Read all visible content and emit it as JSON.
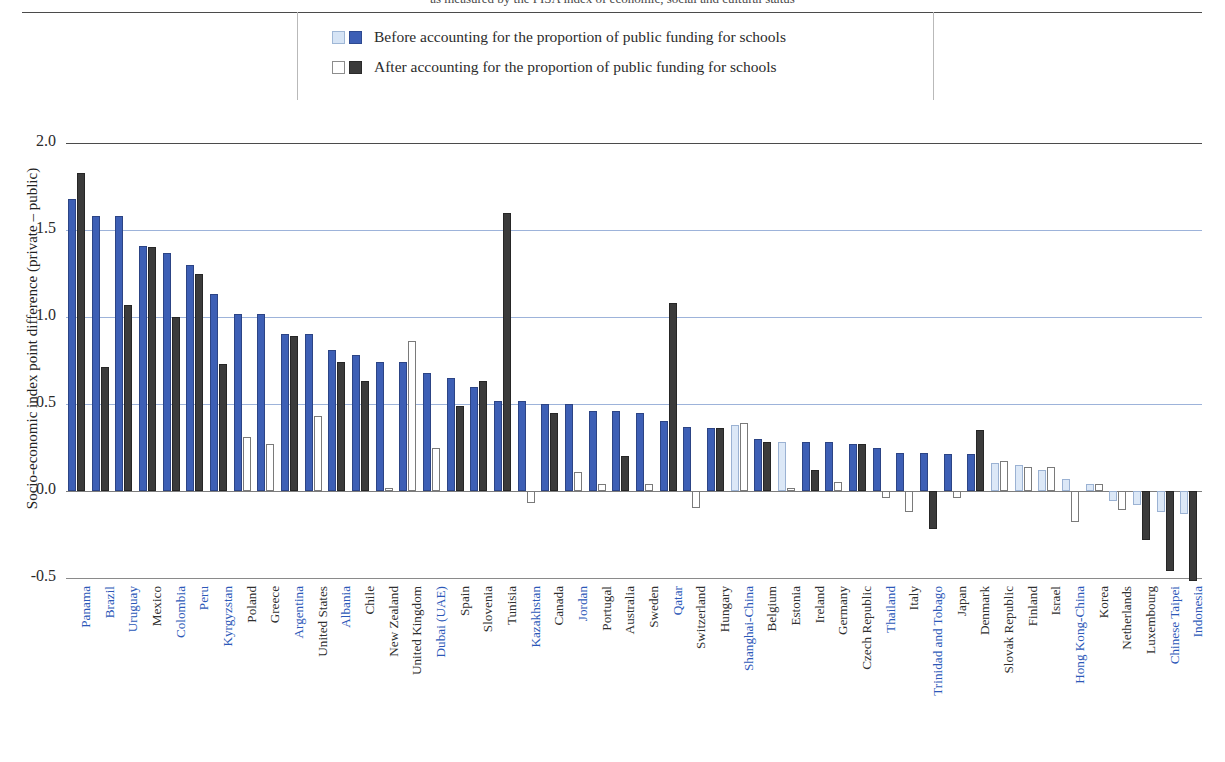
{
  "header": {
    "title_partial": "as measured by the PISA index of economic, social and cultural status"
  },
  "legend": {
    "items": [
      {
        "label": "Before accounting for the proportion of public funding for schools",
        "swatches": [
          "light-blue",
          "blue"
        ]
      },
      {
        "label": "After accounting for the proportion of public funding for schools",
        "swatches": [
          "white",
          "dark-grey"
        ]
      }
    ]
  },
  "colors": {
    "before_significant": "#3d5fb5",
    "before_nonsignificant": "#dce8f7",
    "after_significant": "#3b3b3b",
    "after_nonsignificant": "#ffffff",
    "gridline": "#9db3da",
    "highlight_label": "#2c58b8",
    "normal_label": "#2e2e2e"
  },
  "chart_data": {
    "type": "bar",
    "title": "as measured by the PISA index of economic, social and cultural status",
    "xlabel": "",
    "ylabel": "Socio-economic index point difference (private – public)",
    "ylim": [
      -0.5,
      2.0
    ],
    "yticks": [
      "2.0",
      "1.5",
      "1.0",
      "0.5",
      "0.0",
      "-0.5"
    ],
    "ytick_values": [
      2.0,
      1.5,
      1.0,
      0.5,
      0.0,
      -0.5
    ],
    "grid": true,
    "legend_position": "top-center",
    "categories": [
      "Panama",
      "Brazil",
      "Uruguay",
      "Mexico",
      "Colombia",
      "Peru",
      "Kyrgyzstan",
      "Poland",
      "Greece",
      "Argentina",
      "United States",
      "Albania",
      "Chile",
      "New Zealand",
      "United Kingdom",
      "Dubai (UAE)",
      "Spain",
      "Slovenia",
      "Tunisia",
      "Kazakhstan",
      "Canada",
      "Jordan",
      "Portugal",
      "Australia",
      "Sweden",
      "Qatar",
      "Switzerland",
      "Hungary",
      "Shanghai-China",
      "Belgium",
      "Estonia",
      "Ireland",
      "Germany",
      "Czech Republic",
      "Thailand",
      "Italy",
      "Trinidad and Tobago",
      "Japan",
      "Denmark",
      "Slovak Republic",
      "Finland",
      "Israel",
      "Hong Kong-China",
      "Korea",
      "Netherlands",
      "Luxembourg",
      "Chinese Taipei",
      "Indonesia"
    ],
    "category_highlight": [
      true,
      true,
      true,
      false,
      true,
      true,
      true,
      false,
      false,
      true,
      false,
      true,
      false,
      false,
      false,
      true,
      false,
      false,
      false,
      true,
      false,
      true,
      false,
      false,
      false,
      true,
      false,
      false,
      true,
      false,
      false,
      false,
      false,
      false,
      true,
      false,
      true,
      false,
      false,
      false,
      false,
      false,
      true,
      false,
      false,
      false,
      true,
      true
    ],
    "series": [
      {
        "name": "Before accounting for the proportion of public funding for schools",
        "values": [
          1.68,
          1.58,
          1.58,
          1.41,
          1.37,
          1.3,
          1.13,
          1.02,
          1.02,
          0.9,
          0.9,
          0.81,
          0.78,
          0.74,
          0.74,
          0.68,
          0.65,
          0.6,
          0.52,
          0.52,
          0.5,
          0.5,
          0.46,
          0.46,
          0.45,
          0.4,
          0.37,
          0.36,
          0.38,
          0.3,
          0.28,
          0.28,
          0.28,
          0.27,
          0.25,
          0.22,
          0.22,
          0.21,
          0.21,
          0.16,
          0.15,
          0.12,
          0.07,
          0.04,
          -0.06,
          -0.08,
          -0.12,
          -0.13
        ],
        "significance": [
          true,
          true,
          true,
          true,
          true,
          true,
          true,
          true,
          true,
          true,
          true,
          true,
          true,
          true,
          true,
          true,
          true,
          true,
          true,
          true,
          true,
          true,
          true,
          true,
          true,
          true,
          true,
          true,
          false,
          true,
          false,
          true,
          true,
          true,
          true,
          true,
          true,
          true,
          true,
          false,
          false,
          false,
          false,
          false,
          false,
          false,
          false,
          false
        ]
      },
      {
        "name": "After accounting for the proportion of public funding for schools",
        "values": [
          1.83,
          0.71,
          1.07,
          1.4,
          1.0,
          1.25,
          0.73,
          0.31,
          0.27,
          0.89,
          0.43,
          0.74,
          0.63,
          0.02,
          0.86,
          0.25,
          0.49,
          0.63,
          1.6,
          -0.07,
          0.45,
          0.11,
          0.04,
          0.2,
          0.04,
          1.08,
          -0.1,
          0.36,
          0.39,
          0.28,
          0.02,
          0.12,
          0.05,
          0.27,
          -0.04,
          -0.12,
          -0.22,
          -0.04,
          0.35,
          0.17,
          0.14,
          0.14,
          -0.18,
          0.04,
          -0.11,
          -0.28,
          -0.46,
          -0.52
        ],
        "significance": [
          true,
          true,
          true,
          true,
          true,
          true,
          true,
          false,
          false,
          true,
          false,
          true,
          true,
          false,
          false,
          false,
          true,
          true,
          true,
          false,
          true,
          false,
          false,
          true,
          false,
          true,
          false,
          true,
          false,
          true,
          false,
          true,
          false,
          true,
          false,
          false,
          true,
          false,
          true,
          false,
          false,
          false,
          false,
          false,
          false,
          true,
          true,
          true
        ]
      }
    ]
  }
}
